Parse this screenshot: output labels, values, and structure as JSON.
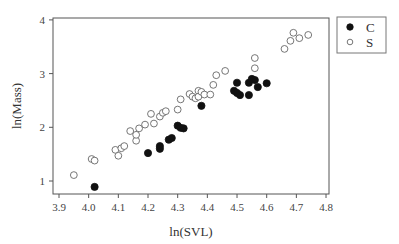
{
  "chart_data": {
    "type": "scatter",
    "title": "",
    "xlabel": "ln(SVL)",
    "ylabel": "ln(Mass)",
    "xlim": [
      3.87,
      4.82
    ],
    "ylim": [
      0.75,
      4.05
    ],
    "x_ticks": [
      3.9,
      4.0,
      4.1,
      4.2,
      4.3,
      4.4,
      4.5,
      4.6,
      4.7,
      4.8
    ],
    "x_tick_labels": [
      "3.9",
      "4.0",
      "4.1",
      "4.2",
      "4.3",
      "4.4",
      "4.5",
      "4.6",
      "4.7",
      "4.8"
    ],
    "y_ticks": [
      1,
      2,
      3,
      4
    ],
    "y_tick_labels": [
      "1",
      "2",
      "3",
      "4"
    ],
    "grid": false,
    "legend_position": "outside-top-right",
    "series": [
      {
        "name": "C",
        "marker": "filled-circle",
        "color": "#111111",
        "points": [
          [
            4.02,
            0.89
          ],
          [
            4.2,
            1.52
          ],
          [
            4.24,
            1.65
          ],
          [
            4.24,
            1.6
          ],
          [
            4.27,
            1.77
          ],
          [
            4.28,
            1.8
          ],
          [
            4.3,
            2.03
          ],
          [
            4.31,
            1.99
          ],
          [
            4.32,
            1.98
          ],
          [
            4.38,
            2.4
          ],
          [
            4.5,
            2.83
          ],
          [
            4.49,
            2.68
          ],
          [
            4.5,
            2.64
          ],
          [
            4.51,
            2.6
          ],
          [
            4.54,
            2.6
          ],
          [
            4.54,
            2.83
          ],
          [
            4.55,
            2.9
          ],
          [
            4.56,
            2.88
          ],
          [
            4.57,
            2.75
          ],
          [
            4.6,
            2.82
          ]
        ]
      },
      {
        "name": "S",
        "marker": "open-circle",
        "color": "#555555",
        "points": [
          [
            3.95,
            1.11
          ],
          [
            4.01,
            1.41
          ],
          [
            4.02,
            1.38
          ],
          [
            4.09,
            1.58
          ],
          [
            4.1,
            1.47
          ],
          [
            4.11,
            1.61
          ],
          [
            4.12,
            1.65
          ],
          [
            4.14,
            1.93
          ],
          [
            4.16,
            1.75
          ],
          [
            4.16,
            1.86
          ],
          [
            4.17,
            1.98
          ],
          [
            4.19,
            2.05
          ],
          [
            4.21,
            2.25
          ],
          [
            4.22,
            2.07
          ],
          [
            4.24,
            2.2
          ],
          [
            4.25,
            2.27
          ],
          [
            4.26,
            2.3
          ],
          [
            4.3,
            2.33
          ],
          [
            4.31,
            2.52
          ],
          [
            4.34,
            2.62
          ],
          [
            4.35,
            2.57
          ],
          [
            4.36,
            2.54
          ],
          [
            4.37,
            2.68
          ],
          [
            4.37,
            2.57
          ],
          [
            4.38,
            2.66
          ],
          [
            4.39,
            2.61
          ],
          [
            4.41,
            2.61
          ],
          [
            4.42,
            2.79
          ],
          [
            4.43,
            2.97
          ],
          [
            4.46,
            3.05
          ],
          [
            4.56,
            3.29
          ],
          [
            4.56,
            3.1
          ],
          [
            4.66,
            3.46
          ],
          [
            4.68,
            3.61
          ],
          [
            4.69,
            3.76
          ],
          [
            4.71,
            3.66
          ],
          [
            4.74,
            3.72
          ]
        ]
      }
    ]
  },
  "legend": {
    "items": [
      {
        "label": "C",
        "marker": "filled-circle"
      },
      {
        "label": "S",
        "marker": "open-circle"
      }
    ]
  }
}
